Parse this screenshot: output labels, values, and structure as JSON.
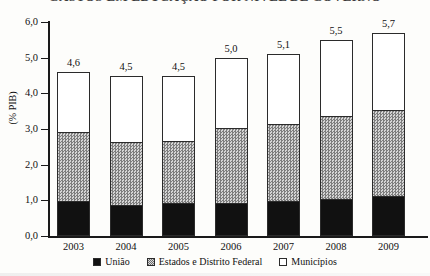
{
  "title": {
    "text": "GASTOS EM EDUCAÇÃO POR NÍVEL DE GOVERNO",
    "cropped": true
  },
  "axes": {
    "y_axis_title": "(% PIB)",
    "y_ticks": [
      "0,0",
      "1,0",
      "2,0",
      "3,0",
      "4,0",
      "5,0",
      "6,0"
    ],
    "x_ticks": [
      "2003",
      "2004",
      "2005",
      "2006",
      "2007",
      "2008",
      "2009"
    ]
  },
  "legend": {
    "items": [
      {
        "label": "União",
        "swatch": "black-square-icon"
      },
      {
        "label": "Estados e Distrito Federal",
        "swatch": "gray-hatched-square-icon"
      },
      {
        "label": "Municípios",
        "swatch": "white-square-icon"
      }
    ]
  },
  "bar_totals": [
    "4,6",
    "4,5",
    "4,5",
    "5,0",
    "5,1",
    "5,5",
    "5,7"
  ],
  "chart_data": {
    "type": "bar",
    "stacked": true,
    "title": "GASTOS EM EDUCAÇÃO POR NÍVEL DE GOVERNO",
    "xlabel": "",
    "ylabel": "(% PIB)",
    "ylim": [
      0,
      6
    ],
    "ytick_step": 1,
    "grid": false,
    "legend_position": "bottom",
    "decimal_separator": ",",
    "categories": [
      "2003",
      "2004",
      "2005",
      "2006",
      "2007",
      "2008",
      "2009"
    ],
    "series": [
      {
        "name": "União",
        "color": "#111111",
        "values": [
          0.95,
          0.85,
          0.9,
          0.9,
          0.95,
          1.0,
          1.1
        ]
      },
      {
        "name": "Estados e Distrito Federal",
        "color": "#a8a8a8",
        "values": [
          1.95,
          1.75,
          1.75,
          2.1,
          2.15,
          2.35,
          2.4
        ]
      },
      {
        "name": "Municípios",
        "color": "#ffffff",
        "values": [
          1.7,
          1.9,
          1.85,
          2.0,
          2.0,
          2.15,
          2.2
        ]
      }
    ],
    "totals": [
      4.6,
      4.5,
      4.5,
      5.0,
      5.1,
      5.5,
      5.7
    ],
    "total_labels": [
      "4,6",
      "4,5",
      "4,5",
      "5,0",
      "5,1",
      "5,5",
      "5,7"
    ],
    "cumulative_tops": {
      "uniao": [
        0.95,
        0.85,
        0.9,
        0.9,
        0.95,
        1.0,
        1.1
      ],
      "estados": [
        2.9,
        2.6,
        2.65,
        3.0,
        3.1,
        3.35,
        3.5
      ],
      "municipios": [
        4.6,
        4.5,
        4.5,
        5.0,
        5.1,
        5.5,
        5.7
      ]
    }
  }
}
